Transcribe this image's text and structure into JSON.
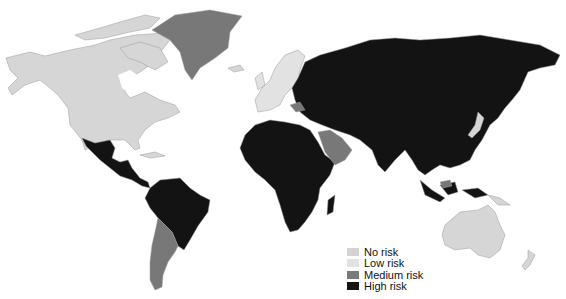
{
  "map": {
    "type": "choropleth",
    "projection": "world",
    "border_color": "#9a9a9a",
    "categories": {
      "none": {
        "label": "No risk",
        "color": "#d4d4d4"
      },
      "low": {
        "label": "Low risk",
        "color": "#e0e0e0"
      },
      "medium": {
        "label": "Medium risk",
        "color": "#777777"
      },
      "high": {
        "label": "High risk",
        "color": "#121212"
      }
    },
    "regions": [
      {
        "name": "North America (Canada, USA, Alaska)",
        "risk": "none"
      },
      {
        "name": "Greenland",
        "risk": "medium"
      },
      {
        "name": "Mexico and Central America",
        "risk": "high"
      },
      {
        "name": "Caribbean",
        "risk": "none"
      },
      {
        "name": "Northern South America and Brazil",
        "risk": "high"
      },
      {
        "name": "Argentina, Chile, Uruguay",
        "risk": "medium"
      },
      {
        "name": "Western and Northern Europe",
        "risk": "low"
      },
      {
        "name": "Eastern Europe and Russia",
        "risk": "high"
      },
      {
        "name": "Balkans",
        "risk": "medium"
      },
      {
        "name": "Africa",
        "risk": "high"
      },
      {
        "name": "Arabian Peninsula",
        "risk": "medium"
      },
      {
        "name": "Middle East, Central, South and East Asia",
        "risk": "high"
      },
      {
        "name": "Japan",
        "risk": "none"
      },
      {
        "name": "Southeast Asia",
        "risk": "high"
      },
      {
        "name": "Borneo (part)",
        "risk": "medium"
      },
      {
        "name": "Australia",
        "risk": "none"
      },
      {
        "name": "New Zealand",
        "risk": "none"
      }
    ]
  },
  "legend": {
    "items": [
      {
        "label": "No risk",
        "color": "#d4d4d4"
      },
      {
        "label": "Low risk",
        "color": "#e3e3e3"
      },
      {
        "label": "Medium risk",
        "color": "#7a7a7a"
      },
      {
        "label": "High risk",
        "color": "#141414"
      }
    ]
  }
}
